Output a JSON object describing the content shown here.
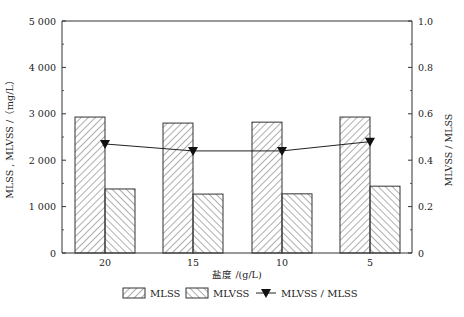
{
  "chart_data": {
    "type": "bar",
    "title": "",
    "xlabel": "盐度 /(g/L)",
    "ylabel": "MLSS , MLVSS /（mg/L）",
    "y2label": "MLVSS / MLSS",
    "categories": [
      "20",
      "15",
      "10",
      "5"
    ],
    "ylim": [
      0,
      5000
    ],
    "y_ticks": [
      "0",
      "1 000",
      "2 000",
      "3 000",
      "4 000",
      "5 000"
    ],
    "y2lim": [
      0,
      1.0
    ],
    "y2_ticks": [
      "0",
      "0.2",
      "0.4",
      "0.6",
      "0.8",
      "1.0"
    ],
    "grid": false,
    "legend_position": "bottom",
    "series": [
      {
        "name": "MLSS",
        "type": "bar",
        "pattern": "hatch-forward",
        "axis": "left",
        "values": [
          2930,
          2800,
          2820,
          2930
        ]
      },
      {
        "name": "MLVSS",
        "type": "bar",
        "pattern": "hatch-backward",
        "axis": "left",
        "values": [
          1380,
          1270,
          1275,
          1440
        ]
      },
      {
        "name": "MLVSS / MLSS",
        "type": "line",
        "marker": "triangle-down",
        "axis": "right",
        "values": [
          0.47,
          0.44,
          0.44,
          0.48
        ]
      }
    ]
  },
  "legend": {
    "items": [
      "MLSS",
      "MLVSS",
      "MLVSS / MLSS"
    ]
  }
}
